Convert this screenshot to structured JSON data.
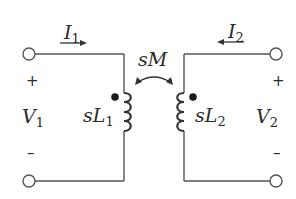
{
  "diagram": {
    "type": "coupled-inductor circuit (transformer s-domain model)",
    "labels": {
      "i1": {
        "main": "I",
        "sub": "1"
      },
      "i2": {
        "main": "I",
        "sub": "2"
      },
      "v1": {
        "main": "V",
        "sub": "1"
      },
      "v2": {
        "main": "V",
        "sub": "2"
      },
      "l1": {
        "main": "sL",
        "sub": "1"
      },
      "l2": {
        "main": "sL",
        "sub": "2"
      },
      "mutual": "sM"
    },
    "polarity": {
      "left_plus": "+",
      "left_minus": "–",
      "right_plus": "+",
      "right_minus": "–"
    },
    "colors": {
      "line": "#555555",
      "text": "#2a2a2a",
      "dot": "#1a1a1a",
      "background": "#ffffff"
    }
  }
}
